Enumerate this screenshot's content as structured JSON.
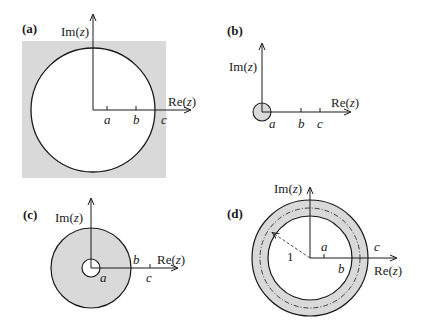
{
  "figure": {
    "colors": {
      "shade": "#d9d9d9",
      "line": "#1a1a1a",
      "background": "#ffffff"
    },
    "panels": [
      {
        "id": "a",
        "label": "(a)",
        "im_axis_label": "Im(z)",
        "re_axis_label": "Re(z)",
        "points": [
          "a",
          "b",
          "c"
        ],
        "description": "Exterior of circle through c shaded (|z| > c region shaded in bounding square); circle interior unshaded"
      },
      {
        "id": "b",
        "label": "(b)",
        "im_axis_label": "Im(z)",
        "re_axis_label": "Re(z)",
        "points": [
          "a",
          "b",
          "c"
        ],
        "description": "Small shaded disk of radius a around origin"
      },
      {
        "id": "c",
        "label": "(c)",
        "im_axis_label": "Im(z)",
        "re_axis_label": "Re(z)",
        "points": [
          "a",
          "b",
          "c"
        ],
        "description": "Shaded annulus a < |z| < b"
      },
      {
        "id": "d",
        "label": "(d)",
        "im_axis_label": "Im(z)",
        "re_axis_label": "Re(z)",
        "points": [
          "a",
          "b",
          "c"
        ],
        "radius_label": "1",
        "description": "Shaded annulus b < |z| < c containing dash-dot unit circle, dashed radius line labeled 1"
      }
    ]
  }
}
